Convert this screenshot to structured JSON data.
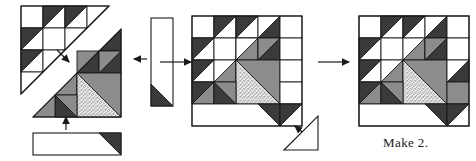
{
  "diagram": {
    "caption": "Make 2.",
    "palette": {
      "dark": "#3a3a3a",
      "gray": "#8c8c8c",
      "stipple_base": "#e8e8e8",
      "stipple_dot": "#707070",
      "white": "#ffffff",
      "outline": "#1a1a1a"
    },
    "steps": [
      {
        "id": "step-1",
        "name": "exploded-block-with-strips",
        "label": "Block halves with side strip and bottom strip"
      },
      {
        "id": "step-2",
        "name": "joined-block-with-corner-triangle",
        "label": "Joined block with corner triangle"
      },
      {
        "id": "step-3",
        "name": "finished-block",
        "label": "Finished block"
      }
    ],
    "arrows": [
      {
        "name": "arrow-step1-to-step2",
        "direction": "right"
      },
      {
        "name": "arrow-step2-to-step3",
        "direction": "right"
      },
      {
        "name": "arrow-side-strip",
        "direction": "left"
      },
      {
        "name": "arrow-bottom-strip",
        "direction": "up"
      },
      {
        "name": "arrow-corner-triangle",
        "direction": "up-left"
      }
    ],
    "pieces": [
      {
        "name": "side-strip",
        "fabrics": [
          "white",
          "dark"
        ]
      },
      {
        "name": "bottom-strip",
        "fabrics": [
          "white",
          "dark"
        ]
      },
      {
        "name": "corner-triangle",
        "fabrics": [
          "white"
        ]
      }
    ]
  }
}
